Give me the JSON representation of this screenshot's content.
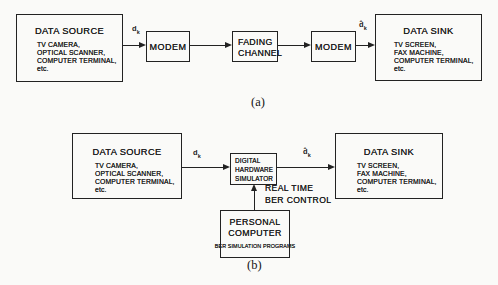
{
  "colors": {
    "background": "#fafaf8",
    "ink": "#222222"
  },
  "diagram_a": {
    "caption": "(a)",
    "data_source": {
      "title": "DATA SOURCE",
      "items": [
        "TV CAMERA,",
        "OPTICAL SCANNER,",
        "COMPUTER TERMINAL, etc."
      ]
    },
    "modem_tx": {
      "label": "MODEM"
    },
    "fading_channel": {
      "lines": [
        "FADING",
        "CHANNEL"
      ]
    },
    "modem_rx": {
      "label": "MODEM"
    },
    "data_sink": {
      "title": "DATA SINK",
      "items": [
        "TV SCREEN,",
        "FAX MACHINE,",
        "COMPUTER TERMINAL, etc."
      ]
    },
    "signal_in": {
      "base": "d",
      "sub": "k"
    },
    "signal_out": {
      "base": "d̂",
      "sub": "k"
    }
  },
  "diagram_b": {
    "caption": "(b)",
    "data_source": {
      "title": "DATA SOURCE",
      "items": [
        "TV CAMERA,",
        "OPTICAL SCANNER,",
        "COMPUTER TERMINAL, etc."
      ]
    },
    "simulator": {
      "lines": [
        "DIGITAL",
        "HARDWARE",
        "SIMULATOR"
      ]
    },
    "data_sink": {
      "title": "DATA SINK",
      "items": [
        "TV SCREEN,",
        "FAX MACHINE,",
        "COMPUTER TERMINAL, etc."
      ]
    },
    "personal_computer": {
      "lines": [
        "PERSONAL",
        "COMPUTER"
      ],
      "subtitle": "BER SIMULATION PROGRAMS"
    },
    "control_label": {
      "lines": [
        "REAL TIME",
        "BER CONTROL"
      ]
    },
    "signal_in": {
      "base": "d",
      "sub": "k"
    },
    "signal_out": {
      "base": "d̂",
      "sub": "k"
    }
  }
}
